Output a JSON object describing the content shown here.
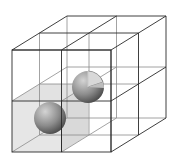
{
  "diagram": {
    "type": "3d-cubic-lattice",
    "grid": "2x2x2",
    "colors": {
      "background": "#ffffff",
      "edge": "#2a2a2a",
      "hidden_edge": "#8a8a8a",
      "shaded_cell": "#dcdcdc",
      "sphere_light": "#c8c8c8",
      "sphere_dark": "#4a4a4a"
    },
    "geometry": {
      "front_top_left": [
        12,
        50
      ],
      "front_size": [
        99,
        102
      ],
      "depth_offset": [
        55,
        -34
      ]
    },
    "spheres": [
      {
        "name": "sphere-front-lower",
        "center": [
          50,
          118
        ],
        "radius": 16,
        "cutaway": false
      },
      {
        "name": "sphere-back-upper",
        "center": [
          88,
          87
        ],
        "radius": 16,
        "cutaway": true
      }
    ],
    "shaded_cell": "front-bottom-left"
  }
}
